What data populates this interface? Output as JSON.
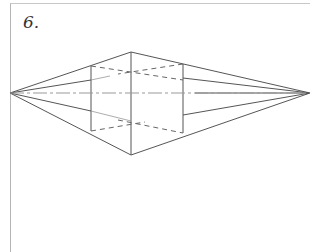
{
  "figure": {
    "label": "6.",
    "colors": {
      "line": "#555555",
      "hidden": "#666666",
      "center": "#888888",
      "frame": "#b5b5b5"
    }
  }
}
